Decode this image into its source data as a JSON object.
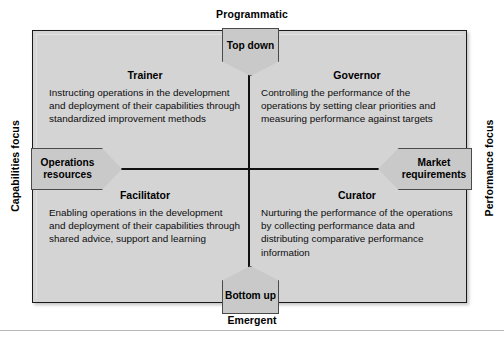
{
  "axes": {
    "top_label": "Programmatic",
    "bottom_label": "Emergent",
    "left_label": "Capabilities focus",
    "right_label": "Performance focus"
  },
  "callouts": {
    "top": "Top down",
    "bottom": "Bottom up",
    "left": "Operations resources",
    "right": "Market requirements"
  },
  "quadrants": {
    "top_left": {
      "title": "Trainer",
      "body": "Instructing operations in the development and deployment of their capabilities through standardized improvement methods"
    },
    "top_right": {
      "title": "Governor",
      "body": "Controlling the performance of the operations by setting clear priorities and measuring performance against targets"
    },
    "bottom_left": {
      "title": "Facilitator",
      "body": "Enabling operations in the development and deployment of their capabilities through shared advice, support and learning"
    },
    "bottom_right": {
      "title": "Curator",
      "body": "Nurturing the performance of the operations by collecting performance data and distributing comparative performance information"
    }
  },
  "colors": {
    "panel_background": "#d4d4d4",
    "panel_border": "#1a1a1a",
    "callout_background": "#c9c9c9",
    "callout_border": "#4a4a4a",
    "axis_line": "#111111",
    "text": "#000000"
  },
  "chart_data": {
    "type": "table",
    "xlabel": "Top down ↔ Bottom up",
    "ylabel": "Operations resources ↔ Market requirements",
    "x_axis_poles": [
      "Programmatic",
      "Emergent"
    ],
    "y_axis_poles": [
      "Capabilities focus",
      "Performance focus"
    ],
    "categories": [
      "Trainer",
      "Governor",
      "Facilitator",
      "Curator"
    ],
    "cells": [
      {
        "position": "top-left",
        "label": "Trainer",
        "vertical_pole": "Programmatic",
        "horizontal_pole": "Capabilities focus",
        "description": "Instructing operations in the development and deployment of their capabilities through standardized improvement methods"
      },
      {
        "position": "top-right",
        "label": "Governor",
        "vertical_pole": "Programmatic",
        "horizontal_pole": "Performance focus",
        "description": "Controlling the performance of the operations by setting clear priorities and measuring performance against targets"
      },
      {
        "position": "bottom-left",
        "label": "Facilitator",
        "vertical_pole": "Emergent",
        "horizontal_pole": "Capabilities focus",
        "description": "Enabling operations in the development and deployment of their capabilities through shared advice, support and learning"
      },
      {
        "position": "bottom-right",
        "label": "Curator",
        "vertical_pole": "Emergent",
        "horizontal_pole": "Performance focus",
        "description": "Nurturing the performance of the operations by collecting performance data and distributing comparative performance information"
      }
    ],
    "axis_end_markers": [
      "Top down",
      "Bottom up",
      "Operations resources",
      "Market requirements"
    ],
    "grid": false,
    "legend": "none"
  }
}
